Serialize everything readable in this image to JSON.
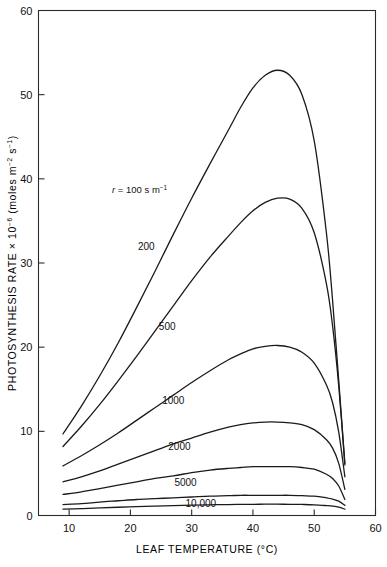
{
  "chart_data": {
    "type": "line",
    "title": "",
    "xlabel": "LEAF TEMPERATURE (°C)",
    "ylabel": "PHOTOSYNTHESIS RATE × 10⁻⁶ (moles m⁻² s⁻¹)",
    "ylabel_parts": {
      "main": "PHOTOSYNTHESIS RATE",
      "times": "×",
      "base": "10",
      "exp": "−6",
      "units": "(moles m",
      "units_exp1": "−2",
      "units_mid": " s",
      "units_exp2": "−1",
      "units_close": ")"
    },
    "xlim": [
      5,
      60
    ],
    "ylim": [
      0,
      60
    ],
    "xticks": [
      10,
      20,
      30,
      40,
      50,
      60
    ],
    "xtick_labels": [
      "10",
      "20",
      "30",
      "40",
      "50",
      "60"
    ],
    "yticks": [
      0,
      10,
      20,
      30,
      40,
      50,
      60
    ],
    "ytick_labels": [
      "0",
      "10",
      "20",
      "30",
      "40",
      "50",
      "60"
    ],
    "grid": false,
    "legend_position": "inline-curve-labels",
    "annotation": {
      "text": "r = 100 s m⁻¹",
      "prefix_italic": "r",
      "equals": " = ",
      "value": "100 s m",
      "exponent": "−1",
      "x": 17.0,
      "y": 38.3
    },
    "x": [
      9,
      12,
      15,
      18,
      21,
      24,
      27,
      30,
      33,
      36,
      38,
      40,
      42,
      44,
      46,
      48,
      50,
      52,
      53,
      54,
      55
    ],
    "series": [
      {
        "name": "100",
        "label": "r = 100 s m⁻¹",
        "resistance": 100,
        "units": "s m⁻¹",
        "label_x": 25.0,
        "label_y": 33.5,
        "values": [
          9.7,
          13.0,
          16.6,
          20.5,
          24.7,
          29.0,
          33.4,
          37.7,
          41.8,
          45.8,
          48.5,
          50.8,
          52.3,
          52.9,
          52.3,
          50.0,
          44.5,
          33.5,
          25.5,
          16.0,
          6.2
        ]
      },
      {
        "name": "200",
        "label": "200",
        "resistance": 200,
        "units": "s m⁻¹",
        "label_x": 22.6,
        "label_y": 31.6,
        "values": [
          8.2,
          10.6,
          13.2,
          16.0,
          18.9,
          21.9,
          24.9,
          27.9,
          30.7,
          33.2,
          34.8,
          36.2,
          37.2,
          37.7,
          37.6,
          36.5,
          33.6,
          27.5,
          22.5,
          15.4,
          6.0
        ]
      },
      {
        "name": "500",
        "label": "500",
        "resistance": 500,
        "units": "s m⁻¹",
        "label_x": 26.0,
        "label_y": 22.0,
        "values": [
          5.9,
          7.1,
          8.4,
          9.8,
          11.3,
          12.8,
          14.3,
          15.8,
          17.2,
          18.5,
          19.2,
          19.8,
          20.1,
          20.2,
          20.0,
          19.4,
          18.1,
          15.5,
          13.4,
          9.9,
          4.6
        ]
      },
      {
        "name": "1000",
        "label": "1000",
        "resistance": 1000,
        "units": "s m⁻¹",
        "label_x": 27.0,
        "label_y": 13.3,
        "values": [
          4.0,
          4.6,
          5.3,
          6.1,
          6.9,
          7.7,
          8.5,
          9.2,
          9.9,
          10.5,
          10.8,
          11.0,
          11.1,
          11.1,
          11.0,
          10.8,
          10.2,
          9.0,
          8.0,
          6.2,
          3.1
        ]
      },
      {
        "name": "2000",
        "label": "2000",
        "resistance": 2000,
        "units": "s m⁻¹",
        "label_x": 28.0,
        "label_y": 7.8,
        "values": [
          2.5,
          2.8,
          3.2,
          3.6,
          4.0,
          4.4,
          4.7,
          5.1,
          5.4,
          5.6,
          5.7,
          5.8,
          5.8,
          5.8,
          5.8,
          5.7,
          5.5,
          4.9,
          4.4,
          3.5,
          1.9
        ]
      },
      {
        "name": "5000",
        "label": "5000",
        "resistance": 5000,
        "units": "s m⁻¹",
        "label_x": 29.0,
        "label_y": 3.5,
        "values": [
          1.3,
          1.4,
          1.6,
          1.75,
          1.9,
          2.0,
          2.1,
          2.2,
          2.3,
          2.35,
          2.4,
          2.4,
          2.4,
          2.4,
          2.4,
          2.35,
          2.3,
          2.1,
          1.95,
          1.7,
          1.2
        ]
      },
      {
        "name": "10,000",
        "label": "10,000",
        "resistance": 10000,
        "units": "s m⁻¹",
        "label_x": 31.5,
        "label_y": 1.0,
        "values": [
          0.75,
          0.82,
          0.9,
          0.98,
          1.05,
          1.12,
          1.18,
          1.23,
          1.27,
          1.3,
          1.32,
          1.33,
          1.34,
          1.34,
          1.33,
          1.31,
          1.27,
          1.18,
          1.12,
          1.0,
          0.75
        ]
      }
    ]
  },
  "figure": {
    "background": "#ffffff",
    "line_color": "#1a1a1a",
    "axis_color": "#2b2b2b"
  }
}
